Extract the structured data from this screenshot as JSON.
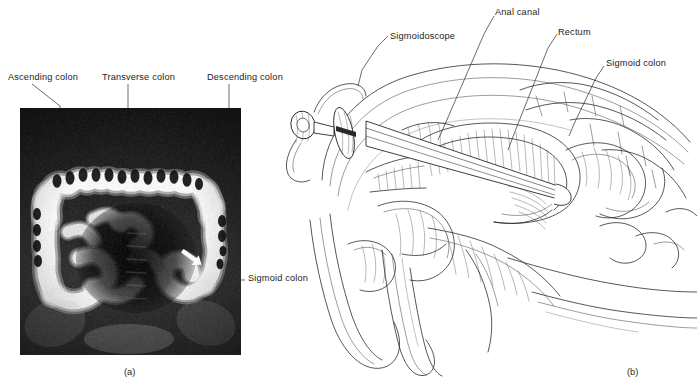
{
  "figure": {
    "panels": [
      {
        "id": "a",
        "caption": "(a)",
        "type": "radiograph",
        "description": "Barium enema radiograph of the large intestine",
        "labels": [
          {
            "name": "ascending-colon",
            "text": "Ascending colon"
          },
          {
            "name": "transverse-colon",
            "text": "Transverse colon"
          },
          {
            "name": "descending-colon",
            "text": "Descending colon"
          },
          {
            "name": "sigmoid-colon",
            "text": "Sigmoid colon"
          }
        ]
      },
      {
        "id": "b",
        "caption": "(b)",
        "type": "line-drawing",
        "description": "Sagittal section of male pelvis with sigmoidoscope inserted",
        "labels": [
          {
            "name": "sigmoidoscope",
            "text": "Sigmoidoscope"
          },
          {
            "name": "anal-canal",
            "text": "Anal canal"
          },
          {
            "name": "rectum",
            "text": "Rectum"
          },
          {
            "name": "sigmoid-colon",
            "text": "Sigmoid colon"
          }
        ]
      }
    ]
  },
  "colors": {
    "background": "#ffffff",
    "ink": "#1c1c1c",
    "leader": "#2b2b2b",
    "film_dark": "#111111",
    "film_bright": "#f4f4f4"
  }
}
